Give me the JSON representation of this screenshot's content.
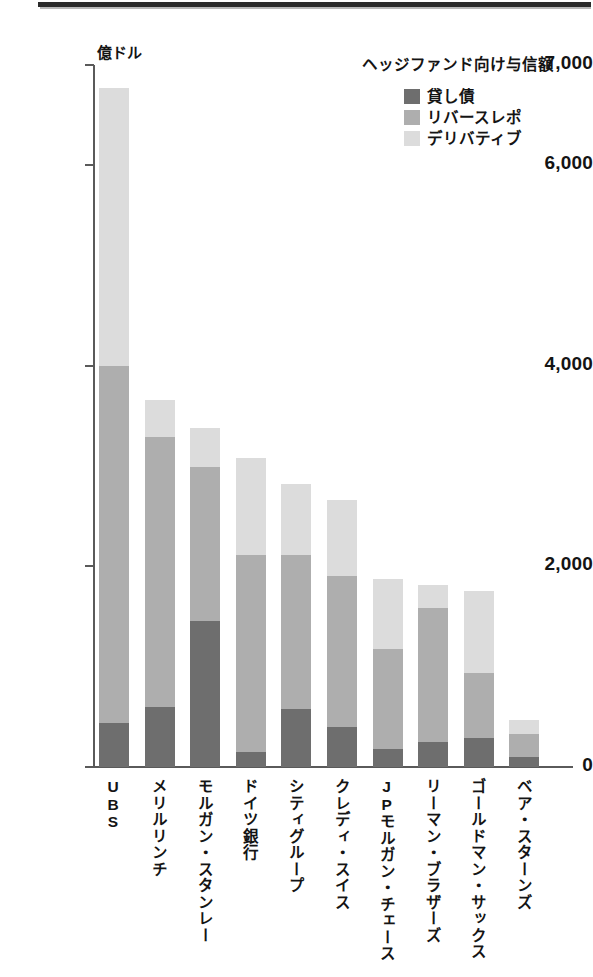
{
  "chart_data": {
    "type": "bar",
    "stacked": true,
    "title": "ヘッジファンド向け与信額",
    "xlabel": "",
    "ylabel": "億ドル",
    "unit_label": "億ドル",
    "ylim": [
      0,
      7000
    ],
    "yticks": [
      0,
      2000,
      4000,
      6000,
      7000
    ],
    "ytick_labels": [
      "0",
      "2,000",
      "4,000",
      "6,000",
      "7,000"
    ],
    "grid": false,
    "legend_position": "top-right",
    "categories": [
      "UBS",
      "メリルリンチ",
      "モルガン・スタンレー",
      "ドイツ銀行",
      "シティグループ",
      "クレディ・スイス",
      "JPモルガン・チェース",
      "リーマン・ブラザーズ",
      "ゴールドマン・サックス",
      "ベア・スターンズ"
    ],
    "series": [
      {
        "name": "貸し債",
        "color": "#6e6e6e",
        "values": [
          440,
          600,
          1460,
          150,
          580,
          400,
          180,
          250,
          290,
          100
        ]
      },
      {
        "name": "リバースレポ",
        "color": "#aeaeae",
        "values": [
          3560,
          2690,
          1530,
          1960,
          1530,
          1500,
          1000,
          1340,
          650,
          230
        ]
      },
      {
        "name": "デリバティブ",
        "color": "#dcdcdc",
        "values": [
          2770,
          370,
          390,
          970,
          710,
          760,
          690,
          220,
          820,
          140
        ]
      }
    ],
    "totals": [
      6770,
      3660,
      3380,
      3080,
      2820,
      2660,
      1870,
      1810,
      1760,
      470
    ]
  },
  "legend": {
    "title": "ヘッジファンド向け与信額",
    "items": [
      {
        "label": "貸し債",
        "color": "#6e6e6e"
      },
      {
        "label": "リバースレポ",
        "color": "#aeaeae"
      },
      {
        "label": "デリバティブ",
        "color": "#dcdcdc"
      }
    ]
  }
}
